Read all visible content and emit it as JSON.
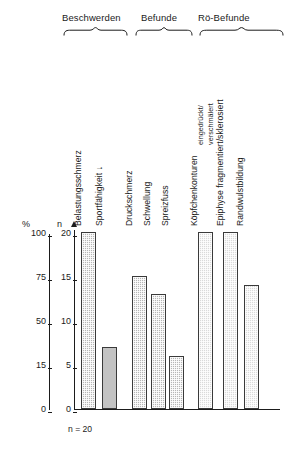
{
  "chart_data": {
    "type": "bar",
    "title": "",
    "subtitle": "",
    "xlabel": "",
    "ylabel": "n",
    "ylabel_secondary": "%",
    "grid": false,
    "legend_position": "none",
    "note": "n = 20",
    "axis_percent": {
      "header": "%",
      "ticks": [
        "0",
        "15",
        "50",
        "75",
        "100"
      ],
      "tick_values": [
        0,
        25,
        50,
        75,
        100
      ],
      "range": [
        0,
        100
      ]
    },
    "axis_count": {
      "header": "n",
      "ticks": [
        "0",
        "5",
        "10",
        "15",
        "20"
      ],
      "tick_values": [
        0,
        5,
        10,
        15,
        20
      ],
      "range": [
        0,
        20
      ]
    },
    "groups": [
      {
        "label": "Beschwerden",
        "bars": 2
      },
      {
        "label": "Befunde",
        "bars": 3
      },
      {
        "label": "Rö-Befunde",
        "bars": 3
      }
    ],
    "categories": [
      "Belastungsschmerz",
      "Sportfähigkeit ↓",
      "Druckschmerz",
      "Schwellung",
      "Spreizfuss",
      "Köpfchenkonturen",
      "Epiphyse fragmentiert/skleросiert",
      "Randwulstbildung"
    ],
    "category_sublabels": [
      "",
      "",
      "",
      "",
      "",
      "eingedrückt/\nverschmälert",
      "",
      ""
    ],
    "values": [
      20,
      7,
      15,
      13,
      6,
      20,
      20,
      14
    ],
    "values_percent": [
      100,
      35,
      75,
      65,
      30,
      100,
      100,
      70
    ],
    "series": [
      {
        "name": "Häufigkeit",
        "values": [
          20,
          7,
          15,
          13,
          6,
          20,
          20,
          14
        ]
      }
    ],
    "bar_styles": [
      "dark",
      "plain",
      "dark",
      "dark",
      "dark",
      "light",
      "light",
      "light"
    ]
  },
  "labels": {
    "group_beschwerden": "Beschwerden",
    "group_befunde": "Befunde",
    "group_roe_befunde": "Rö-Befunde",
    "cat_0": "Belastungsschmerz",
    "cat_1": "Sportfähigkeit ↓",
    "cat_2": "Druckschmerz",
    "cat_3": "Schwellung",
    "cat_4": "Spreizfuss",
    "cat_5": "Köpfchenkonturen",
    "cat_6": "Epiphyse fragmentiert/sklerosiert",
    "cat_7": "Randwulstbildung",
    "sub_5_line1": "eingedrückt/",
    "sub_5_line2": "verschmälert",
    "axis_percent_header": "%",
    "axis_count_header": "n",
    "pct_100": "100",
    "pct_75": "75",
    "pct_50": "50",
    "pct_25": "15",
    "pct_0": "0",
    "n_20": "20",
    "n_15": "15",
    "n_10": "10",
    "n_5": "5",
    "n_0": "0",
    "footnote": "n = 20"
  },
  "colors": {
    "ink": "#1b1b1b",
    "bar_border": "#3a3a3a",
    "bar_dark": "#b6b6b6",
    "bar_plain": "#c3c3c3",
    "bar_light": "#dadada",
    "background": "#ffffff"
  }
}
